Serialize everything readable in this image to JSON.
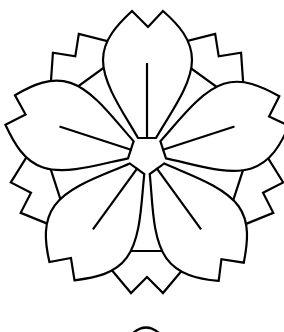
{
  "image": {
    "title": "Sakura blossom emblem",
    "subject": "cherry-blossom line drawing",
    "petal_count": 5,
    "colors": {
      "background": "#ffffff",
      "line": "#000000"
    },
    "partial_circle_below": true
  }
}
